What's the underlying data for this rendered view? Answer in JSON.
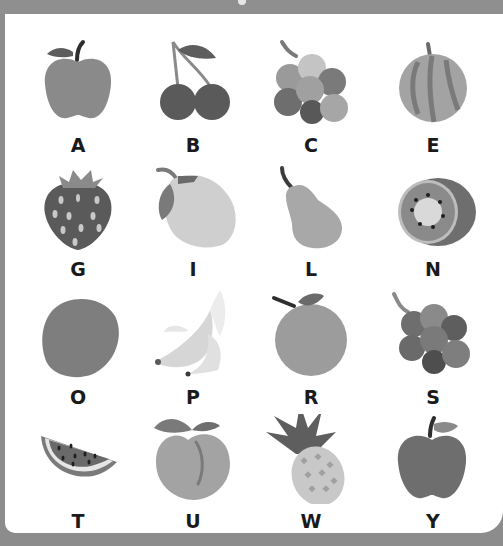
{
  "worksheet": {
    "title": "Fruit alphabet",
    "items": [
      {
        "letter": "A",
        "fruit": "apple",
        "icon": "apple-icon"
      },
      {
        "letter": "B",
        "fruit": "cherries",
        "icon": "cherries-icon"
      },
      {
        "letter": "C",
        "fruit": "grapes",
        "icon": "grapes-icon"
      },
      {
        "letter": "E",
        "fruit": "melon",
        "icon": "melon-icon"
      },
      {
        "letter": "G",
        "fruit": "strawberry",
        "icon": "strawberry-icon"
      },
      {
        "letter": "I",
        "fruit": "lemon",
        "icon": "lemon-icon"
      },
      {
        "letter": "L",
        "fruit": "pear",
        "icon": "pear-icon"
      },
      {
        "letter": "N",
        "fruit": "kiwi",
        "icon": "kiwi-icon"
      },
      {
        "letter": "O",
        "fruit": "lime",
        "icon": "lime-icon"
      },
      {
        "letter": "P",
        "fruit": "banana",
        "icon": "banana-icon"
      },
      {
        "letter": "R",
        "fruit": "orange",
        "icon": "orange-icon"
      },
      {
        "letter": "S",
        "fruit": "grapes",
        "icon": "grapes-dark-icon"
      },
      {
        "letter": "T",
        "fruit": "watermelon",
        "icon": "watermelon-icon"
      },
      {
        "letter": "U",
        "fruit": "peach",
        "icon": "peach-icon"
      },
      {
        "letter": "W",
        "fruit": "pineapple",
        "icon": "pineapple-icon"
      },
      {
        "letter": "Y",
        "fruit": "apple",
        "icon": "apple-red-icon"
      }
    ]
  },
  "colors": {
    "frame": "#8c8c8c",
    "card": "#ffffff",
    "label": "#1a1a1a"
  }
}
